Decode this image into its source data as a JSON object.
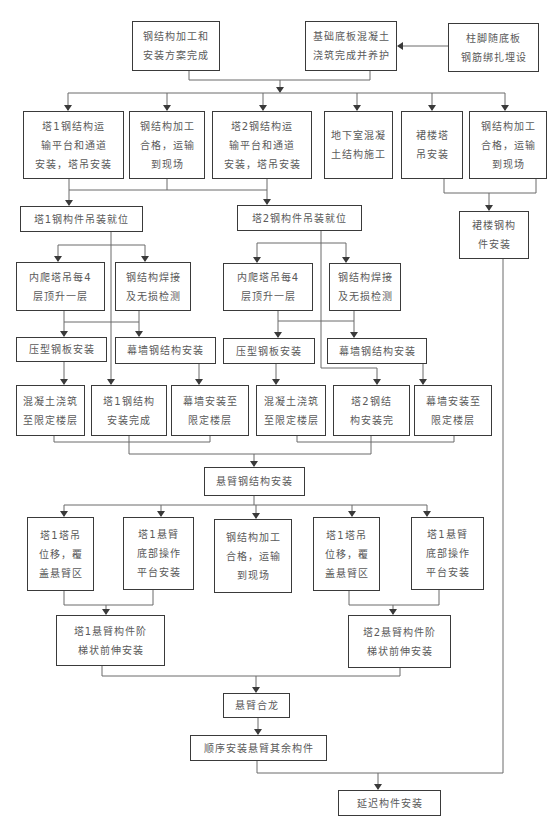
{
  "diagram": {
    "title": "",
    "nodes": {
      "steel_plan": {
        "lines": [
          "钢结构加工和",
          "安装方案完成"
        ]
      },
      "foundation": {
        "lines": [
          "基础底板混凝土",
          "浇筑完成并养护"
        ]
      },
      "column_base": {
        "lines": [
          "柱脚随底板",
          "钢筋绑扎埋设"
        ]
      },
      "t1_platform": {
        "lines": [
          "塔1钢结构运",
          "输平台和通道",
          "安装，塔吊安装"
        ]
      },
      "steel_fab_1": {
        "lines": [
          "钢结构加工",
          "合格，运输",
          "到现场"
        ]
      },
      "t2_platform": {
        "lines": [
          "塔2钢结构运",
          "输平台和通道",
          "安装，塔吊安装"
        ]
      },
      "basement": {
        "lines": [
          "地下室混凝",
          "土结构施工"
        ]
      },
      "podium_crane": {
        "lines": [
          "裙楼塔",
          "吊安装"
        ]
      },
      "steel_fab_2": {
        "lines": [
          "钢结构加工",
          "合格，运输",
          "到现场"
        ]
      },
      "t1_hoist": {
        "lines": [
          "塔1钢构件吊装就位"
        ]
      },
      "t2_hoist": {
        "lines": [
          "塔2钢构件吊装就位"
        ]
      },
      "podium_steel": {
        "lines": [
          "裙楼钢构",
          "件安装"
        ]
      },
      "t1_climb": {
        "lines": [
          "内爬塔吊每4",
          "层顶升一层"
        ]
      },
      "t1_weld": {
        "lines": [
          "钢结构焊接",
          "及无损检测"
        ]
      },
      "t2_climb": {
        "lines": [
          "内爬塔吊每4",
          "层顶升一层"
        ]
      },
      "t2_weld": {
        "lines": [
          "钢结构焊接",
          "及无损检测"
        ]
      },
      "t1_deck": {
        "lines": [
          "压型钢板安装"
        ]
      },
      "t1_curtain_steel": {
        "lines": [
          "幕墙钢结构安装"
        ]
      },
      "t2_deck": {
        "lines": [
          "压型钢板安装"
        ]
      },
      "t2_curtain_steel": {
        "lines": [
          "幕墙钢结构安装"
        ]
      },
      "t1_concrete": {
        "lines": [
          "混凝土浇筑",
          "至限定楼层"
        ]
      },
      "t1_done": {
        "lines": [
          "塔1钢结构",
          "安装完成"
        ]
      },
      "t1_curtain_floor": {
        "lines": [
          "幕墙安装至",
          "限定楼层"
        ]
      },
      "t2_concrete": {
        "lines": [
          "混凝土浇筑",
          "至限定楼层"
        ]
      },
      "t2_done": {
        "lines": [
          "塔2钢结",
          "构安装完"
        ]
      },
      "t2_curtain_floor": {
        "lines": [
          "幕墙安装至",
          "限定楼层"
        ]
      },
      "cantilever": {
        "lines": [
          "悬臂钢结构安装"
        ]
      },
      "t1_crane_shift": {
        "lines": [
          "塔1塔吊",
          "位移，覆",
          "盖悬臂区"
        ]
      },
      "t1_cant_platform": {
        "lines": [
          "塔1悬臂",
          "底部操作",
          "平台安装"
        ]
      },
      "steel_fab_3": {
        "lines": [
          "钢结构加工",
          "合格，运输",
          "到现场"
        ]
      },
      "t1_crane_shift_b": {
        "lines": [
          "塔1塔吊",
          "位移，覆",
          "盖悬臂区"
        ]
      },
      "t1_cant_platform_b": {
        "lines": [
          "塔1悬臂",
          "底部操作",
          "平台安装"
        ]
      },
      "t1_stepped": {
        "lines": [
          "塔1悬臂构件阶",
          "梯状前伸安装"
        ]
      },
      "t2_stepped": {
        "lines": [
          "塔2悬臂构件阶",
          "梯状前伸安装"
        ]
      },
      "closure": {
        "lines": [
          "悬臂合龙"
        ]
      },
      "remaining": {
        "lines": [
          "顺序安装悬臂其余构件"
        ]
      },
      "delayed": {
        "lines": [
          "延迟构件安装"
        ]
      }
    }
  }
}
